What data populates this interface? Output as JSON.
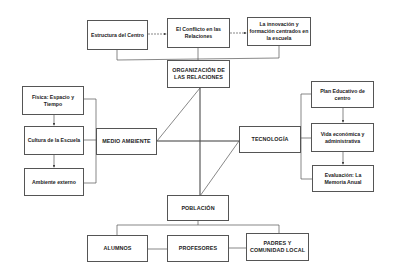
{
  "diagram": {
    "top_row": [
      {
        "id": "estructura",
        "label": "Estructura del Centro"
      },
      {
        "id": "conflicto",
        "label": "El Conflicto en las Relaciones"
      },
      {
        "id": "innovacion",
        "label": "La innovación y formación centrados en la escuela"
      }
    ],
    "center": {
      "organizacion": "ORGANIZACIÓN DE LAS RELACIONES",
      "medio_ambiente": "MEDIO AMBIENTE",
      "tecnologia": "TECNOLOGÍA",
      "poblacion": "POBLACIÓN"
    },
    "left_column": [
      {
        "id": "fisica",
        "label": "Física: Espacio y Tiempo"
      },
      {
        "id": "cultura",
        "label": "Cultura de la Escuela"
      },
      {
        "id": "ambiente",
        "label": "Ambiente externo"
      }
    ],
    "right_column": [
      {
        "id": "plan",
        "label": "Plan Educativo de centro"
      },
      {
        "id": "vida",
        "label": "Vida económica y administrativa"
      },
      {
        "id": "evaluacion",
        "label": "Evaluación: La Memoria Anual"
      }
    ],
    "bottom_row": [
      {
        "id": "alumnos",
        "label": "ALUMNOS"
      },
      {
        "id": "profesores",
        "label": "PROFESORES"
      },
      {
        "id": "padres",
        "label": "PADRES Y COMUNIDAD LOCAL"
      }
    ],
    "colors": {
      "line": "#555555",
      "text": "#222222",
      "background": "#ffffff"
    }
  }
}
